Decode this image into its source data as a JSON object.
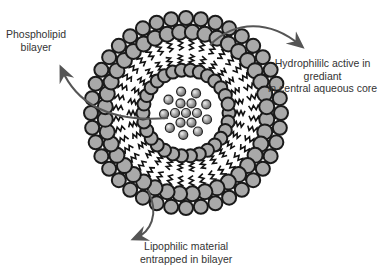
{
  "diagram": {
    "colors": {
      "head_fill": "#a9a9a9",
      "head_stroke": "#1a1a1a",
      "arrow": "#555555",
      "text": "#333333",
      "background": "#ffffff"
    },
    "labels": {
      "phospholipid": {
        "line1": "Phospholipid",
        "line2": "bilayer"
      },
      "hydrophilic": {
        "line1": "Hydrophililc active in",
        "line2": "grediant",
        "line3": "in central aqueous core"
      },
      "lipophilic": {
        "line1": "Lipophilic material",
        "line2": "entrapped in bilayer"
      }
    },
    "geometry": {
      "center": [
        186,
        113
      ],
      "outer_head_radius": 95,
      "outer_head_count": 40,
      "inner_head_radius": 63,
      "inner_head_count": 30,
      "core_radius": 28,
      "core_particle_count": 16
    }
  }
}
